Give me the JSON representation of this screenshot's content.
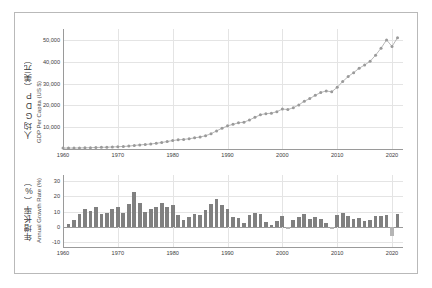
{
  "chart_data": [
    {
      "type": "line",
      "title": "",
      "panel": "upper",
      "xlabel": "",
      "ylabel_cjk": "人均GDP（美元）",
      "ylabel_latin": "GDP Per Capita (US $)",
      "ylim": [
        0,
        55000
      ],
      "yticks": [
        10000,
        20000,
        30000,
        40000,
        50000
      ],
      "ytick_labels": [
        "10,000",
        "20,000",
        "30,000",
        "40,000",
        "50,000"
      ],
      "xlim": [
        1960,
        2022
      ],
      "xticks": [
        1960,
        1970,
        1980,
        1990,
        2000,
        2010,
        2020
      ],
      "xtick_labels": [
        "1960",
        "1970",
        "1980",
        "1990",
        "2000",
        "2010",
        "2020"
      ],
      "grid": true,
      "marker": "circle",
      "series_color": "#9a9a9a",
      "x": [
        1960,
        1961,
        1962,
        1963,
        1964,
        1965,
        1966,
        1967,
        1968,
        1969,
        1970,
        1971,
        1972,
        1973,
        1974,
        1975,
        1976,
        1977,
        1978,
        1979,
        1980,
        1981,
        1982,
        1983,
        1984,
        1985,
        1986,
        1987,
        1988,
        1989,
        1990,
        1991,
        1992,
        1993,
        1994,
        1995,
        1996,
        1997,
        1998,
        1999,
        2000,
        2001,
        2002,
        2003,
        2004,
        2005,
        2006,
        2007,
        2008,
        2009,
        2010,
        2011,
        2012,
        2013,
        2014,
        2015,
        2016,
        2017,
        2018,
        2019,
        2020,
        2021
      ],
      "values": [
        430,
        440,
        460,
        500,
        560,
        620,
        700,
        760,
        830,
        930,
        1050,
        1150,
        1320,
        1620,
        1880,
        2060,
        2300,
        2600,
        3000,
        3400,
        3900,
        4200,
        4400,
        4700,
        5100,
        5500,
        6100,
        7000,
        8300,
        9500,
        10600,
        11300,
        12000,
        12300,
        13300,
        14500,
        15700,
        16200,
        16400,
        17100,
        18300,
        18100,
        18900,
        20200,
        21900,
        23100,
        24600,
        25900,
        26600,
        26200,
        28300,
        30900,
        33200,
        35000,
        37000,
        38500,
        40200,
        43000,
        46200,
        50000,
        47000,
        51000
      ]
    },
    {
      "type": "bar",
      "panel": "lower",
      "title": "",
      "xlabel": "",
      "ylabel_cjk": "年增长率（%）",
      "ylabel_latin": "Annual Growth Rate (%)",
      "ylim": [
        -13,
        34
      ],
      "yticks": [
        -10,
        0,
        10,
        20,
        30
      ],
      "ytick_labels": [
        "-10",
        "0",
        "10",
        "20",
        "30"
      ],
      "xlim": [
        1960,
        2022
      ],
      "xticks": [
        1960,
        1970,
        1980,
        1990,
        2000,
        2010,
        2020
      ],
      "xtick_labels": [
        "1960",
        "1970",
        "1980",
        "1990",
        "2000",
        "2010",
        "2020"
      ],
      "grid": true,
      "bar_color": "#808080",
      "bar_color_negative": "#b5b5b5",
      "categories": [
        1961,
        1962,
        1963,
        1964,
        1965,
        1966,
        1967,
        1968,
        1969,
        1970,
        1971,
        1972,
        1973,
        1974,
        1975,
        1976,
        1977,
        1978,
        1979,
        1980,
        1981,
        1982,
        1983,
        1984,
        1985,
        1986,
        1987,
        1988,
        1989,
        1990,
        1991,
        1992,
        1993,
        1994,
        1995,
        1996,
        1997,
        1998,
        1999,
        2000,
        2001,
        2002,
        2003,
        2004,
        2005,
        2006,
        2007,
        2008,
        2009,
        2010,
        2011,
        2012,
        2013,
        2014,
        2015,
        2016,
        2017,
        2018,
        2019,
        2020,
        2021
      ],
      "values": [
        2.3,
        4.5,
        8.7,
        12.0,
        10.7,
        12.9,
        8.6,
        9.2,
        12.1,
        12.9,
        9.5,
        14.8,
        22.7,
        16.0,
        9.6,
        11.7,
        13.0,
        15.4,
        13.3,
        14.7,
        7.7,
        4.8,
        6.8,
        8.5,
        7.8,
        10.9,
        14.8,
        18.6,
        14.5,
        11.6,
        6.6,
        6.2,
        2.5,
        8.1,
        9.0,
        8.3,
        3.2,
        1.2,
        4.3,
        7.0,
        -1.1,
        4.4,
        6.9,
        8.4,
        5.5,
        6.5,
        5.3,
        2.7,
        -1.5,
        8.0,
        9.2,
        7.4,
        5.4,
        5.7,
        4.1,
        4.4,
        7.0,
        7.4,
        8.2,
        -6.0,
        8.5
      ]
    }
  ]
}
